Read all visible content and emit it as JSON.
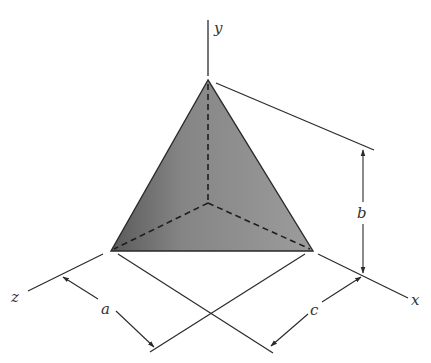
{
  "diagram": {
    "type": "tetrahedron-dimension-drawing",
    "colors": {
      "line": "#2a2a2a",
      "face_light": "#9a9a9a",
      "face_dark": "#5e5e5e",
      "label": "#333333"
    },
    "axes": {
      "x": {
        "label": "x"
      },
      "y": {
        "label": "y"
      },
      "z": {
        "label": "z"
      }
    },
    "dimensions": {
      "a": {
        "label": "a"
      },
      "b": {
        "label": "b"
      },
      "c": {
        "label": "c"
      }
    },
    "vertices": {
      "apex": [
        208,
        80
      ],
      "bottom_left": [
        111,
        251
      ],
      "bottom_right": [
        313,
        251
      ],
      "hidden_origin": [
        208,
        203
      ]
    }
  }
}
